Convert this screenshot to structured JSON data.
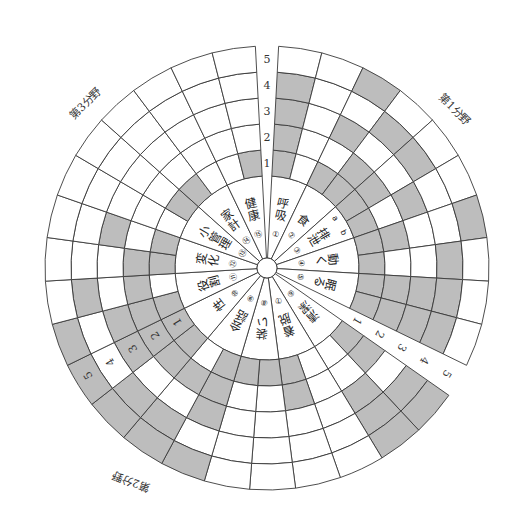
{
  "diagram": {
    "center": [
      267,
      268
    ],
    "hub_radius": 10,
    "label_radius": 92,
    "ring_radii": [
      92,
      118,
      144,
      170,
      196,
      222
    ],
    "shade_color": "#bdbdbd",
    "line_color": "#3a3a3a",
    "scale_labels": [
      "1",
      "2",
      "3",
      "4",
      "5"
    ],
    "sub_column_labels": [
      "a",
      "b"
    ],
    "domains": [
      {
        "title": "第1分野",
        "start_deg": 87,
        "end_deg": -26,
        "title_pos": [
          452,
          112
        ],
        "title_rot": 45,
        "items": [
          {
            "no": "①",
            "label": "呼吸",
            "shade": [
              [
                1,
                0
              ],
              [
                1,
                0
              ],
              [
                1,
                0
              ],
              [
                1,
                0
              ],
              [
                0,
                0
              ]
            ]
          },
          {
            "no": "②",
            "label": "食",
            "shade": [
              [
                1,
                1
              ],
              [
                0,
                1
              ],
              [
                1,
                0
              ],
              [
                0,
                1
              ],
              [
                1,
                0
              ]
            ]
          },
          {
            "no": "③",
            "label": "排泄",
            "shade": [
              [
                1,
                1
              ],
              [
                1,
                0
              ],
              [
                0,
                1
              ],
              [
                1,
                0
              ],
              [
                0,
                0
              ]
            ]
          },
          {
            "no": "④",
            "label": "動く",
            "shade": [
              [
                1,
                1
              ],
              [
                1,
                0
              ],
              [
                0,
                0
              ],
              [
                0,
                1
              ],
              [
                1,
                0
              ]
            ]
          },
          {
            "no": "⑤",
            "label": "眠る",
            "shade": [
              [
                1,
                1
              ],
              [
                1,
                1
              ],
              [
                1,
                1
              ],
              [
                1,
                1
              ],
              [
                0,
                0
              ]
            ]
          }
        ]
      },
      {
        "title": "第2分野",
        "start_deg": -35,
        "end_deg": -154,
        "title_pos": [
          132,
          478
        ],
        "title_rot": 200,
        "items": [
          {
            "no": "⑥",
            "label": "清潔",
            "shade": [
              [
                1,
                0
              ],
              [
                1,
                0
              ],
              [
                0,
                1
              ],
              [
                1,
                1
              ],
              [
                1,
                1
              ]
            ]
          },
          {
            "no": "⑦",
            "label": "着脱",
            "shade": [
              [
                0,
                1
              ],
              [
                0,
                1
              ],
              [
                0,
                0
              ],
              [
                0,
                0
              ],
              [
                0,
                0
              ]
            ]
          },
          {
            "no": "⑧",
            "label": "装い",
            "shade": [
              [
                1,
                1
              ],
              [
                0,
                0
              ],
              [
                0,
                0
              ],
              [
                0,
                0
              ],
              [
                0,
                0
              ]
            ]
          },
          {
            "no": "⑨",
            "label": "会話",
            "shade": [
              [
                1,
                0
              ],
              [
                1,
                1
              ],
              [
                1,
                0
              ],
              [
                0,
                1
              ],
              [
                1,
                1
              ]
            ]
          },
          {
            "no": "⑩",
            "label": "性",
            "shade": [
              [
                1,
                1
              ],
              [
                1,
                1
              ],
              [
                0,
                1
              ],
              [
                1,
                0
              ],
              [
                1,
                1
              ]
            ]
          }
        ]
      },
      {
        "title": "第3分野",
        "start_deg": 206,
        "end_deg": 93,
        "title_pos": [
          88,
          106
        ],
        "title_rot": -45,
        "items": [
          {
            "no": "⑪",
            "label": "役割",
            "shade": [
              [
                1,
                0
              ],
              [
                1,
                1
              ],
              [
                1,
                0
              ],
              [
                0,
                1
              ],
              [
                1,
                0
              ]
            ]
          },
          {
            "no": "⑫",
            "label": "変化",
            "shade": [
              [
                1,
                1
              ],
              [
                1,
                0
              ],
              [
                0,
                1
              ],
              [
                0,
                0
              ],
              [
                0,
                0
              ]
            ]
          },
          {
            "no": "⑬",
            "label": "小管理",
            "shade": [
              [
                0,
                1
              ],
              [
                0,
                0
              ],
              [
                0,
                0
              ],
              [
                0,
                0
              ],
              [
                0,
                0
              ]
            ]
          },
          {
            "no": "⑭",
            "label": "家計",
            "shade": [
              [
                1,
                0
              ],
              [
                0,
                0
              ],
              [
                0,
                0
              ],
              [
                0,
                0
              ],
              [
                0,
                0
              ]
            ]
          },
          {
            "no": "⑮",
            "label": "健康",
            "shade": [
              [
                0,
                1
              ],
              [
                0,
                0
              ],
              [
                0,
                0
              ],
              [
                0,
                0
              ],
              [
                0,
                0
              ]
            ]
          }
        ]
      }
    ],
    "scale_axes_deg": [
      90,
      -30.5,
      211
    ]
  }
}
